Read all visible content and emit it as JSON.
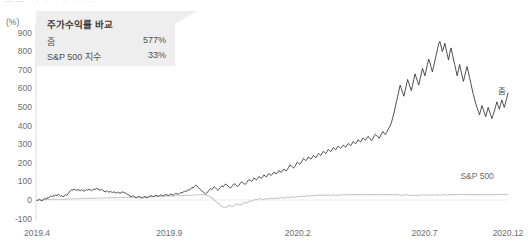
{
  "cut_header_text": "——  ··  · · · ·        ····",
  "legend": {
    "title": "주가수익률 바욕",
    "title_text": "주가수익률 바교",
    "rows": [
      {
        "name": "줌",
        "value": "577%"
      },
      {
        "name": "S&P 500 지수",
        "value": "33%"
      }
    ]
  },
  "series_tags": {
    "zoom": "줌",
    "sp500": "S&P 500"
  },
  "chart_data": {
    "type": "line",
    "title": "주가수익률 바교",
    "xlabel": "",
    "ylabel": "(%)",
    "yunit": "(%)",
    "ylim": [
      -100,
      900
    ],
    "yticks": [
      900,
      800,
      700,
      600,
      500,
      400,
      300,
      200,
      100,
      0,
      -100
    ],
    "ytick_labels": [
      "900",
      "800",
      "700",
      "600",
      "500",
      "400",
      "300",
      "200",
      "100",
      "0",
      "-100"
    ],
    "xticks": [
      0,
      0.2809,
      0.5538,
      0.8229,
      1.0
    ],
    "xtick_labels": [
      "2019.4",
      "2019.9",
      "2020.2",
      "2020.7",
      "2020.12"
    ],
    "grid": false,
    "legend_position": "top-left",
    "annotations": [
      {
        "text": "줌",
        "series": "줌",
        "x": 0.975,
        "y": 560
      },
      {
        "text": "S&P 500",
        "series": "S&P 500",
        "x": 0.95,
        "y": 40
      }
    ],
    "final_values": {
      "줌": 577,
      "S&P 500": 33
    },
    "peak": {
      "series": "줌",
      "value": 855,
      "x_approx": "2020.10"
    },
    "series": [
      {
        "name": "줌",
        "color": "#3a3a3c",
        "values": [
          0,
          2,
          6,
          1,
          -3,
          4,
          10,
          7,
          14,
          11,
          18,
          24,
          20,
          27,
          22,
          30,
          25,
          33,
          28,
          22,
          26,
          19,
          24,
          30,
          27,
          35,
          44,
          52,
          58,
          55,
          60,
          57,
          54,
          58,
          55,
          52,
          57,
          54,
          50,
          53,
          58,
          55,
          60,
          56,
          52,
          57,
          62,
          58,
          66,
          62,
          57,
          54,
          59,
          55,
          50,
          46,
          52,
          48,
          44,
          48,
          45,
          42,
          46,
          43,
          40,
          44,
          41,
          38,
          42,
          46,
          43,
          40,
          36,
          32,
          28,
          24,
          20,
          25,
          22,
          18,
          14,
          18,
          22,
          19,
          15,
          12,
          16,
          20,
          17,
          14,
          18,
          22,
          26,
          23,
          20,
          24,
          28,
          25,
          22,
          26,
          30,
          27,
          24,
          28,
          32,
          29,
          26,
          30,
          34,
          31,
          28,
          33,
          38,
          35,
          32,
          37,
          42,
          40,
          45,
          50,
          47,
          52,
          58,
          55,
          62,
          70,
          66,
          74,
          82,
          78,
          70,
          64,
          58,
          52,
          46,
          40,
          34,
          40,
          48,
          56,
          64,
          58,
          66,
          74,
          68,
          60,
          54,
          62,
          70,
          78,
          72,
          80,
          88,
          84,
          78,
          72,
          66,
          74,
          82,
          90,
          86,
          80,
          74,
          82,
          92,
          100,
          96,
          90,
          86,
          94,
          104,
          112,
          108,
          102,
          110,
          120,
          116,
          110,
          118,
          128,
          124,
          118,
          126,
          136,
          132,
          126,
          134,
          144,
          140,
          134,
          142,
          152,
          148,
          142,
          150,
          160,
          156,
          150,
          158,
          168,
          164,
          158,
          166,
          178,
          190,
          186,
          180,
          174,
          182,
          194,
          206,
          200,
          194,
          202,
          214,
          226,
          220,
          214,
          222,
          234,
          228,
          222,
          230,
          242,
          236,
          230,
          240,
          252,
          248,
          242,
          252,
          264,
          258,
          252,
          262,
          274,
          268,
          262,
          272,
          284,
          278,
          272,
          282,
          292,
          286,
          280,
          288,
          298,
          292,
          286,
          296,
          306,
          300,
          294,
          304,
          316,
          310,
          304,
          314,
          326,
          320,
          314,
          324,
          336,
          330,
          324,
          334,
          344,
          338,
          330,
          322,
          332,
          344,
          356,
          350,
          342,
          334,
          346,
          358,
          370,
          362,
          354,
          364,
          378,
          390,
          402,
          420,
          445,
          470,
          500,
          530,
          560,
          590,
          620,
          600,
          580,
          560,
          590,
          620,
          650,
          630,
          610,
          590,
          620,
          650,
          680,
          660,
          640,
          620,
          650,
          680,
          710,
          690,
          670,
          700,
          730,
          760,
          740,
          715,
          690,
          720,
          750,
          780,
          810,
          840,
          855,
          830,
          800,
          820,
          845,
          815,
          785,
          755,
          790,
          820,
          790,
          760,
          730,
          700,
          670,
          700,
          730,
          700,
          670,
          640,
          665,
          695,
          720,
          690,
          660,
          630,
          600,
          570,
          545,
          520,
          500,
          480,
          460,
          485,
          510,
          490,
          470,
          450,
          475,
          500,
          480,
          460,
          440,
          460,
          480,
          505,
          530,
          510,
          490,
          515,
          540,
          520,
          500,
          525,
          550,
          577
        ]
      },
      {
        "name": "S&P 500",
        "color": "#c9c9cb",
        "values": [
          0,
          1,
          2,
          2,
          3,
          3,
          4,
          4,
          5,
          5,
          4,
          5,
          6,
          6,
          5,
          6,
          7,
          7,
          6,
          5,
          6,
          6,
          7,
          7,
          8,
          8,
          7,
          8,
          8,
          9,
          9,
          8,
          9,
          10,
          10,
          9,
          10,
          10,
          11,
          11,
          10,
          11,
          12,
          12,
          11,
          12,
          13,
          13,
          12,
          13,
          13,
          12,
          13,
          14,
          14,
          13,
          14,
          15,
          15,
          14,
          15,
          15,
          14,
          15,
          16,
          16,
          15,
          16,
          17,
          17,
          16,
          17,
          17,
          16,
          17,
          18,
          18,
          17,
          18,
          18,
          17,
          18,
          19,
          19,
          18,
          19,
          20,
          20,
          19,
          20,
          21,
          21,
          20,
          21,
          22,
          22,
          21,
          22,
          23,
          23,
          22,
          23,
          24,
          24,
          23,
          24,
          25,
          25,
          24,
          25,
          26,
          26,
          25,
          26,
          27,
          27,
          26,
          27,
          28,
          28,
          29,
          30,
          29,
          30,
          31,
          30,
          31,
          32,
          31,
          30,
          28,
          26,
          24,
          20,
          16,
          10,
          4,
          -2,
          -8,
          -14,
          -20,
          -26,
          -32,
          -36,
          -40,
          -38,
          -34,
          -30,
          -26,
          -30,
          -34,
          -30,
          -26,
          -22,
          -18,
          -22,
          -26,
          -22,
          -18,
          -14,
          -10,
          -14,
          -10,
          -6,
          -2,
          -6,
          -2,
          2,
          6,
          2,
          6,
          10,
          8,
          6,
          4,
          8,
          10,
          8,
          6,
          10,
          12,
          10,
          8,
          12,
          14,
          12,
          10,
          14,
          16,
          14,
          12,
          16,
          18,
          16,
          14,
          18,
          20,
          18,
          16,
          20,
          22,
          20,
          18,
          22,
          24,
          22,
          20,
          24,
          26,
          24,
          22,
          26,
          28,
          26,
          24,
          28,
          30,
          28,
          26,
          28,
          30,
          28,
          26,
          28,
          30,
          28,
          26,
          28,
          30,
          28,
          26,
          28,
          30,
          29,
          28,
          30,
          31,
          30,
          29,
          31,
          32,
          31,
          30,
          31,
          32,
          31,
          30,
          31,
          32,
          31,
          30,
          31,
          32,
          31,
          30,
          31,
          32,
          31,
          30,
          31,
          32,
          31,
          30,
          31,
          32,
          31,
          30,
          31,
          32,
          31,
          30,
          31,
          32,
          31,
          30,
          31,
          32,
          31,
          30,
          29,
          28,
          27,
          28,
          29,
          30,
          29,
          28,
          27,
          26,
          27,
          28,
          29,
          28,
          27,
          28,
          29,
          30,
          29,
          28,
          29,
          30,
          29,
          28,
          29,
          30,
          29,
          28,
          29,
          30,
          29,
          28,
          29,
          30,
          31,
          30,
          29,
          30,
          31,
          32,
          31,
          30,
          31,
          32,
          31,
          30,
          31,
          32,
          33,
          32,
          31,
          30,
          31,
          32,
          31,
          30,
          31,
          32,
          31,
          30,
          31,
          32,
          31,
          30,
          31,
          32,
          31,
          30,
          31,
          32,
          31,
          30,
          31,
          32,
          33,
          32,
          31,
          32,
          33,
          32,
          31,
          32,
          33,
          33
        ]
      }
    ]
  }
}
